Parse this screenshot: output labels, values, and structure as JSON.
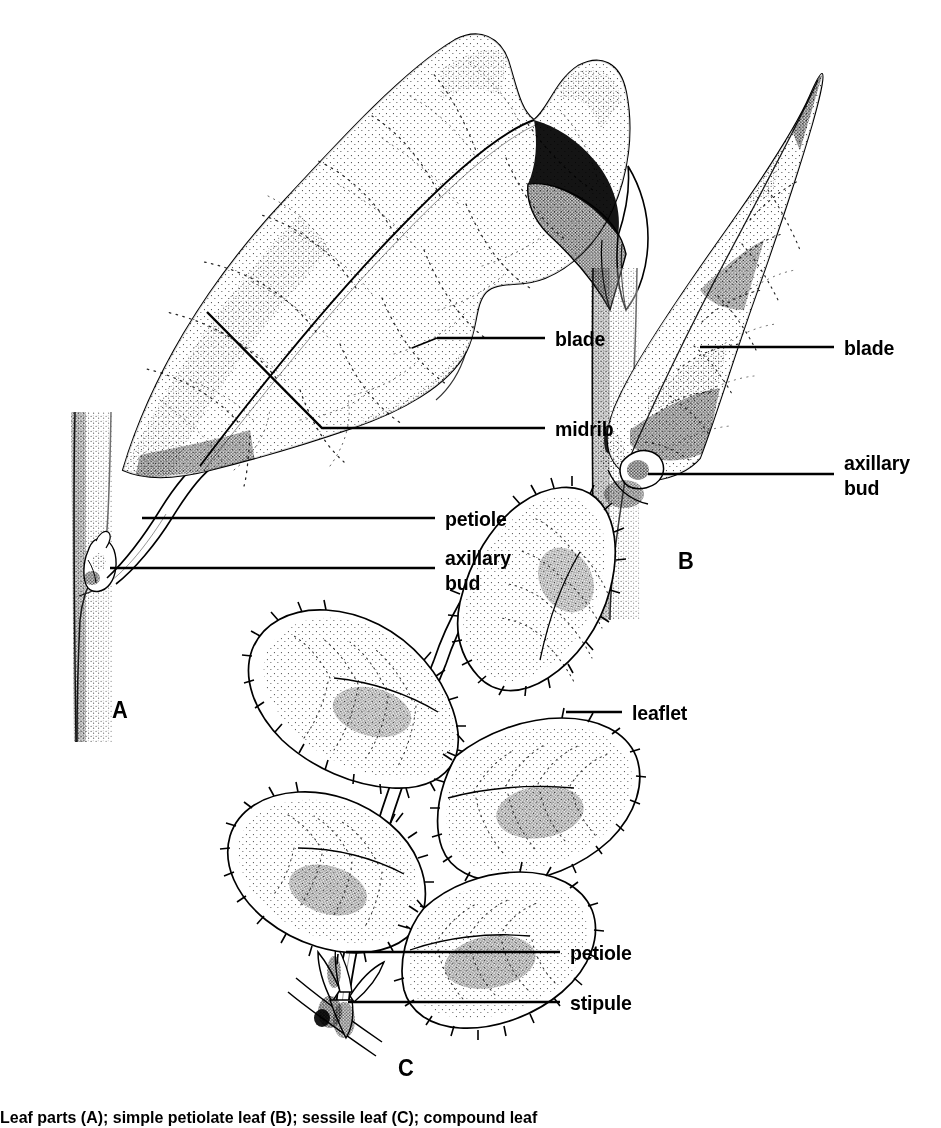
{
  "figure": {
    "background_color": "#ffffff",
    "ink_color": "#000000",
    "style": "black-and-white stippled botanical line drawing"
  },
  "panels": [
    {
      "letter": "A",
      "name": "simple-petiolate-leaf",
      "description": "Large simple leaf with broad wavy-margined blade, prominent midrib, petiole attaching to a vertical stem, and an axillary bud at the node"
    },
    {
      "letter": "B",
      "name": "sessile-leaf",
      "description": "Narrow lanceolate sessile leaf attached directly to the stem without a petiole, with axillary bud at the base"
    },
    {
      "letter": "C",
      "name": "compound-leaf",
      "description": "Compound leaf with five serrate leaflets on a common petiole, with stipules at the base"
    }
  ],
  "labels": {
    "panel_a": [
      {
        "id": "blade",
        "text": "blade"
      },
      {
        "id": "midrib",
        "text": "midrib"
      },
      {
        "id": "petiole",
        "text": "petiole"
      },
      {
        "id": "axillary_bud",
        "line1": "axillary",
        "line2": "bud"
      }
    ],
    "panel_b": [
      {
        "id": "blade",
        "text": "blade"
      },
      {
        "id": "axillary_bud",
        "line1": "axillary",
        "line2": "bud"
      }
    ],
    "panel_c": [
      {
        "id": "leaflet",
        "text": "leaflet"
      },
      {
        "id": "petiole",
        "text": "petiole"
      },
      {
        "id": "stipule",
        "text": "stipule"
      }
    ]
  },
  "caption": {
    "text": "Leaf parts (A); simple petiolate leaf (B); sessile leaf (C); compound leaf",
    "visible": "partially cropped at bottom edge"
  }
}
